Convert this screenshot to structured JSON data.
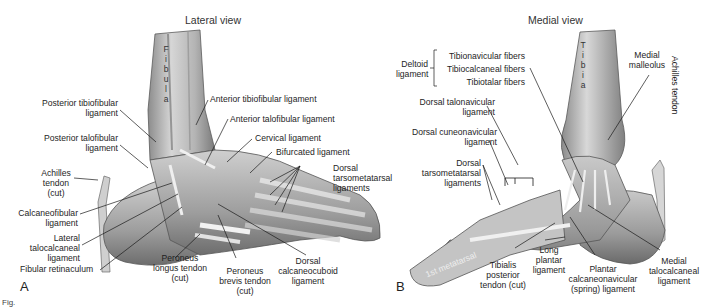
{
  "figure": {
    "figure_mark": "Fig.",
    "panels": [
      {
        "id": "A",
        "letter": "A",
        "title": "Lateral view",
        "bone_label": "F\ni\nb\nu\nl\na",
        "labels": [
          {
            "key": "posterior_tibiofibular",
            "text": "Posterior tibiofibular\nligament"
          },
          {
            "key": "anterior_tibiofibular",
            "text": "Anterior tibiofibular ligament"
          },
          {
            "key": "anterior_talofibular",
            "text": "Anterior talofibular ligament"
          },
          {
            "key": "posterior_talofibular",
            "text": "Posterior talofibular\nligament"
          },
          {
            "key": "cervical",
            "text": "Cervical ligament"
          },
          {
            "key": "bifurcated",
            "text": "Bifurcated ligament"
          },
          {
            "key": "dorsal_tarsometatarsal",
            "text": "Dorsal\ntarsometatarsal\nligaments"
          },
          {
            "key": "achilles",
            "text": "Achilles\ntendon\n(cut)"
          },
          {
            "key": "calcaneofibular",
            "text": "Calcaneofibular\nligament"
          },
          {
            "key": "lateral_talocalcaneal",
            "text": "Lateral\ntalocalcaneal\nligament"
          },
          {
            "key": "fibular_retinaculum",
            "text": "Fibular retinaculum"
          },
          {
            "key": "peroneus_longus",
            "text": "Peroneus\nlongus tendon\n(cut)"
          },
          {
            "key": "peroneus_brevis",
            "text": "Peroneus\nbrevis tendon\n(cut)"
          },
          {
            "key": "dorsal_calcaneocuboid",
            "text": "Dorsal\ncalcaneocuboid\nligament"
          }
        ]
      },
      {
        "id": "B",
        "letter": "B",
        "title": "Medial view",
        "bone_label": "T\ni\nb\ni\na",
        "labels": [
          {
            "key": "deltoid",
            "text": "Deltoid\nligament"
          },
          {
            "key": "tibionavicular",
            "text": "Tibionavicular fibers"
          },
          {
            "key": "tibiocalcaneal",
            "text": "Tibiocalcaneal fibers"
          },
          {
            "key": "tibiotalar",
            "text": "Tibiotalar fibers"
          },
          {
            "key": "medial_malleolus",
            "text": "Medial\nmalleolus"
          },
          {
            "key": "dorsal_talonavicular",
            "text": "Dorsal talonavicular\nligament"
          },
          {
            "key": "dorsal_cuneonavicular",
            "text": "Dorsal cuneonavicular\nligament"
          },
          {
            "key": "dorsal_tarsometatarsal",
            "text": "Dorsal\ntarsometatarsal\nligaments"
          },
          {
            "key": "first_metatarsal",
            "text": "1st metatarsal"
          },
          {
            "key": "achilles",
            "text": "Achilles tendon"
          },
          {
            "key": "tibialis_posterior",
            "text": "Tibialis\nposterior\ntendon (cut)"
          },
          {
            "key": "long_plantar",
            "text": "Long\nplantar\nligament"
          },
          {
            "key": "plantar_calcaneonavicular",
            "text": "Plantar\ncalcaneonavicular\n(spring) ligament"
          },
          {
            "key": "medial_talocalcaneal",
            "text": "Medial\ntalocalcaneal\nligament"
          }
        ]
      }
    ],
    "colors": {
      "bone_light": "#d9d9d9",
      "bone_mid": "#a8a8a8",
      "bone_dark": "#6e6e6e",
      "leader_line": "#1a1a1a"
    }
  }
}
